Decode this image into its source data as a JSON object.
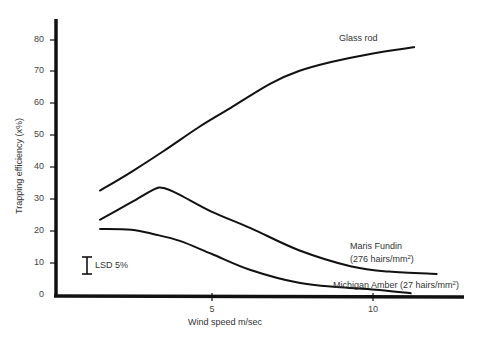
{
  "chart_data": {
    "type": "line",
    "title": "",
    "xlabel": "Wind speed m/sec",
    "ylabel": "Trapping efficiency (x%)",
    "xlim": [
      0,
      12.5
    ],
    "ylim": [
      0,
      85
    ],
    "x_ticks": [
      5,
      10
    ],
    "y_ticks": [
      0,
      10,
      20,
      30,
      40,
      50,
      60,
      70,
      80
    ],
    "grid": false,
    "legend": "inline labels at curve ends",
    "series": [
      {
        "name": "Glass rod",
        "label": "Glass rod",
        "x": [
          1.5,
          2.5,
          3.5,
          4.6,
          5.5,
          6.8,
          7.7,
          8.7,
          10.0,
          11.3
        ],
        "y": [
          32.5,
          38.5,
          45,
          52.5,
          58,
          66,
          70,
          72.8,
          75.5,
          77.5
        ]
      },
      {
        "name": "Maris Fundin (276 hairs/mm²)",
        "label_line1": "Maris Fundin",
        "label_line2": "(276 hairs/mm²)",
        "x": [
          1.5,
          2.5,
          3.2,
          3.5,
          4.0,
          5.0,
          6.2,
          7.7,
          9.3,
          10.5,
          12.0
        ],
        "y": [
          23.4,
          29,
          33,
          33.4,
          31.3,
          26,
          20.9,
          14,
          9,
          7.3,
          6.6
        ]
      },
      {
        "name": "Michigan Amber (27 hairs/mm²)",
        "label": "Michigan Amber (27 hairs/mm²)",
        "x": [
          1.5,
          2.5,
          3.2,
          4.0,
          5.0,
          6.2,
          7.7,
          9.0,
          10.2,
          11.2
        ],
        "y": [
          20.6,
          20.4,
          19,
          16.9,
          12.8,
          7.8,
          3.8,
          2.4,
          1.6,
          0.5
        ]
      }
    ],
    "annotations": [
      {
        "text": "LSD 5%",
        "type": "error-bar",
        "x": 1.1,
        "y_low": 6.5,
        "y_high": 11.8
      }
    ]
  },
  "labels": {
    "xlabel": "Wind speed m/sec",
    "ylabel": "Trapping efficiency (x%)",
    "glass_rod": "Glass rod",
    "maris_1": "Maris Fundin",
    "maris_2": "(276 hairs/mm",
    "maris_sup": "2",
    "maris_close": ")",
    "michigan": "Michigan Amber (27 hairs/mm",
    "michigan_sup": "2",
    "michigan_close": ")",
    "lsd": "LSD 5%",
    "y_ticks": [
      "80",
      "70",
      "60",
      "50",
      "40",
      "30",
      "20",
      "10",
      "0"
    ],
    "x_ticks": [
      "5",
      "10"
    ]
  }
}
